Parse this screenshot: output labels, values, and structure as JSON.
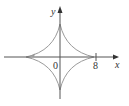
{
  "figure": {
    "type": "astroid",
    "x_axis_label": "x",
    "y_axis_label": "y",
    "origin_label": "0",
    "tick_label": "8",
    "colors": {
      "axis": "#555555",
      "curve": "#9a9a9a",
      "background": "#ffffff"
    }
  }
}
